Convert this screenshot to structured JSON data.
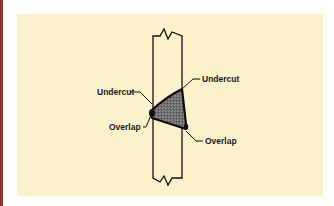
{
  "diagram": {
    "colors": {
      "edge_bar": "#8a3a32",
      "panel_background": "#fbf1cb",
      "line": "#111111",
      "weld_fill": "#6b6b6b"
    },
    "labels": {
      "undercut_left": "Undercut",
      "undercut_right": "Undercut",
      "overlap_left": "Overlap",
      "overlap_right": "Overlap"
    }
  }
}
